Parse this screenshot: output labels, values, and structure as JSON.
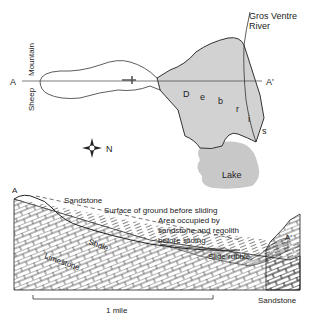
{
  "map": {
    "label_a": "A",
    "label_a_prime": "A'",
    "mountain_word1": "Sheep",
    "mountain_word2": "Mountain",
    "river_line1": "Gros Ventre",
    "river_line2": "River",
    "debris_letters": [
      "D",
      "e",
      "b",
      "r",
      "i",
      "s"
    ],
    "lake": "Lake",
    "north": "N",
    "colors": {
      "debris_fill": "#d2d2d2",
      "lake_fill": "#c8c8c8",
      "outline": "#333333"
    }
  },
  "section": {
    "label_a": "A",
    "label_a_prime": "A'",
    "sandstone_top": "Sandstone",
    "surface_label": "Surface of ground before sliding",
    "area_line1": "Area occupied by",
    "area_line2": "sandstone and regolith",
    "area_line3": "before sliding",
    "shale": "Shale",
    "limestone": "Limestone",
    "slide_rubble": "Slide rubble",
    "sandstone_bottom": "Sandstone",
    "scale_label": "1 mile"
  }
}
